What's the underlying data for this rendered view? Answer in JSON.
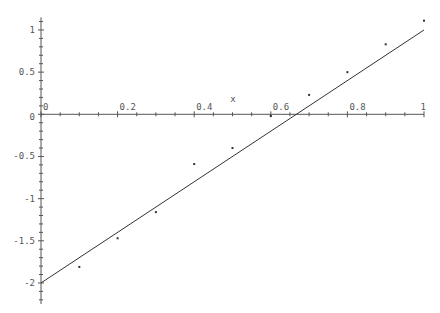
{
  "chart_data": {
    "type": "scatter",
    "title": "",
    "xlabel": "x",
    "ylabel": "",
    "xlim": [
      0,
      1
    ],
    "ylim": [
      -2.25,
      1.15
    ],
    "grid": false,
    "legend": null,
    "x_ticks": [
      0,
      0.2,
      0.4,
      0.6,
      0.8,
      1
    ],
    "x_tick_labels": [
      "0",
      "0.2",
      "0.4",
      "0.6",
      "0.8",
      "1"
    ],
    "y_ticks": [
      1,
      0.5,
      0,
      -0.5,
      -1,
      -1.5,
      -2
    ],
    "y_tick_labels": [
      "1",
      "0.5",
      "0",
      "-0.5",
      "-1",
      "-1.5",
      "-2"
    ],
    "series": [
      {
        "name": "data",
        "kind": "points",
        "x": [
          0.1,
          0.2,
          0.3,
          0.4,
          0.5,
          0.6,
          0.7,
          0.8,
          0.9,
          1.0
        ],
        "y": [
          -1.81,
          -1.47,
          -1.16,
          -0.59,
          -0.4,
          -0.02,
          0.23,
          0.5,
          0.83,
          1.11
        ]
      },
      {
        "name": "fit",
        "kind": "line",
        "x": [
          0,
          1
        ],
        "y": [
          -2,
          1
        ]
      }
    ]
  },
  "colors": {
    "axis": "#555555",
    "line": "#333333",
    "points": "#333333"
  }
}
